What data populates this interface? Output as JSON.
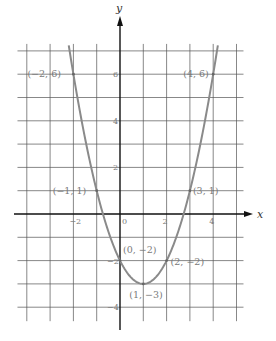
{
  "chart_data": {
    "type": "line",
    "title": "",
    "xlabel": "x",
    "ylabel": "y",
    "equation_implied": "y = x^2 - 2x - 2",
    "xlim": [
      -4,
      5
    ],
    "ylim": [
      -4.5,
      7
    ],
    "grid": true,
    "x_ticks": [
      {
        "value": -2,
        "label": "−2"
      },
      {
        "value": 0,
        "label": "0"
      },
      {
        "value": 2,
        "label": "2"
      },
      {
        "value": 4,
        "label": "4"
      }
    ],
    "y_ticks": [
      {
        "value": 6,
        "label": "6"
      },
      {
        "value": 4,
        "label": "4"
      },
      {
        "value": 2,
        "label": "2"
      },
      {
        "value": -2,
        "label": "−2"
      },
      {
        "value": -4,
        "label": "−4"
      }
    ],
    "series": [
      {
        "name": "parabola",
        "x": [
          -2,
          -1,
          0,
          1,
          2,
          3,
          4
        ],
        "y": [
          6,
          1,
          -2,
          -3,
          -2,
          1,
          6
        ]
      }
    ],
    "points": [
      {
        "x": -2,
        "y": 6,
        "label": "(−2, 6)"
      },
      {
        "x": 4,
        "y": 6,
        "label": "(4, 6)"
      },
      {
        "x": -1,
        "y": 1,
        "label": "(−1, 1)"
      },
      {
        "x": 3,
        "y": 1,
        "label": "(3, 1)"
      },
      {
        "x": 0,
        "y": -2,
        "label": "(0, −2)"
      },
      {
        "x": 2,
        "y": -2,
        "label": "(2, −2)"
      },
      {
        "x": 1,
        "y": -3,
        "label": "(1, −3)"
      }
    ],
    "curve_color": "#8a8a8a",
    "grid_color": "#555555",
    "axis_color": "#111111"
  }
}
